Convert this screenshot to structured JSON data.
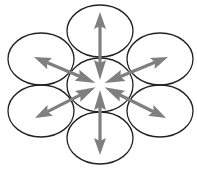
{
  "diagram": {
    "type": "hub-and-spoke ellipse cluster",
    "colors": {
      "ellipse_stroke": "#222222",
      "arrow": "#7f7f7f",
      "background": "#ffffff"
    },
    "center": {
      "name": "center-ellipse",
      "cx": 100,
      "cy": 85,
      "rx": 33,
      "ry": 27
    },
    "outer": [
      {
        "name": "top-ellipse",
        "cx": 100,
        "cy": 31,
        "rx": 33,
        "ry": 26,
        "arrow_tip": [
          100,
          12
        ]
      },
      {
        "name": "upper-right-ellipse",
        "cx": 160,
        "cy": 59,
        "rx": 33,
        "ry": 26,
        "arrow_tip": [
          168,
          57
        ]
      },
      {
        "name": "lower-right-ellipse",
        "cx": 160,
        "cy": 111,
        "rx": 33,
        "ry": 26,
        "arrow_tip": [
          166,
          118
        ]
      },
      {
        "name": "bottom-ellipse",
        "cx": 100,
        "cy": 138,
        "rx": 33,
        "ry": 26,
        "arrow_tip": [
          100,
          155
        ]
      },
      {
        "name": "lower-left-ellipse",
        "cx": 41,
        "cy": 111,
        "rx": 33,
        "ry": 26,
        "arrow_tip": [
          35,
          118
        ]
      },
      {
        "name": "upper-left-ellipse",
        "cx": 41,
        "cy": 59,
        "rx": 33,
        "ry": 26,
        "arrow_tip": [
          34,
          57
        ]
      }
    ]
  }
}
